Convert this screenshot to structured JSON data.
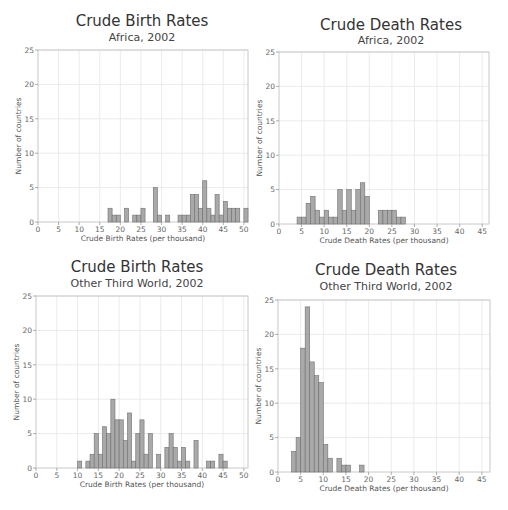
{
  "chart_data": [
    {
      "type": "bar",
      "title": "Crude Birth Rates",
      "subtitle": "Africa, 2002",
      "xlabel": "Crude Birth Rates (per thousand)",
      "ylabel": "Number of countries",
      "xlim": [
        0,
        51
      ],
      "ylim": [
        0,
        25
      ],
      "xticks": [
        0,
        5,
        10,
        15,
        20,
        25,
        30,
        35,
        40,
        45,
        50
      ],
      "yticks": [
        0,
        5,
        10,
        15,
        20,
        25
      ],
      "grid": true,
      "bin_width": 1,
      "x": [
        17,
        18,
        19,
        21,
        23,
        24,
        25,
        28,
        29,
        31,
        34,
        35,
        36,
        37,
        38,
        39,
        40,
        41,
        42,
        43,
        44,
        45,
        46,
        47,
        48,
        50
      ],
      "values": [
        2,
        1,
        1,
        2,
        1,
        1,
        2,
        5,
        1,
        1,
        1,
        1,
        1,
        4,
        4,
        2,
        6,
        2,
        1,
        4,
        1,
        3,
        2,
        2,
        2,
        2
      ]
    },
    {
      "type": "bar",
      "title": "Crude Death Rates",
      "subtitle": "Africa, 2002",
      "xlabel": "Crude Death Rates (per thousand)",
      "ylabel": "Number of countries",
      "xlim": [
        0,
        46.5
      ],
      "ylim": [
        0,
        25
      ],
      "xticks": [
        0,
        5,
        10,
        15,
        20,
        25,
        30,
        35,
        40,
        45
      ],
      "yticks": [
        0,
        5,
        10,
        15,
        20,
        25
      ],
      "grid": true,
      "bin_width": 1,
      "x": [
        4,
        5,
        6,
        7,
        8,
        9,
        10,
        11,
        12,
        13,
        14,
        15,
        16,
        17,
        18,
        19,
        22,
        23,
        24,
        25,
        26,
        27
      ],
      "values": [
        1,
        1,
        3,
        4,
        2,
        1,
        2,
        1,
        1,
        5,
        2,
        5,
        2,
        5,
        6,
        4,
        2,
        2,
        2,
        2,
        1,
        1
      ]
    },
    {
      "type": "bar",
      "title": "Crude Birth Rates",
      "subtitle": "Other Third World, 2002",
      "xlabel": "Crude Birth Rates (per thousand)",
      "ylabel": "Number of countries",
      "xlim": [
        0,
        51
      ],
      "ylim": [
        0,
        25
      ],
      "xticks": [
        0,
        5,
        10,
        15,
        20,
        25,
        30,
        35,
        40,
        45,
        50
      ],
      "yticks": [
        0,
        5,
        10,
        15,
        20,
        25
      ],
      "grid": true,
      "bin_width": 1,
      "x": [
        10,
        12,
        13,
        14,
        15,
        16,
        17,
        18,
        19,
        20,
        21,
        22,
        23,
        24,
        25,
        26,
        27,
        29,
        31,
        32,
        33,
        34,
        35,
        36,
        38,
        41,
        42,
        44,
        45
      ],
      "values": [
        1,
        1,
        2,
        5,
        2,
        6,
        5,
        10,
        7,
        7,
        4,
        8,
        1,
        5,
        7,
        2,
        5,
        2,
        3,
        5,
        3,
        1,
        3,
        1,
        4,
        1,
        1,
        2,
        1
      ]
    },
    {
      "type": "bar",
      "title": "Crude Death Rates",
      "subtitle": "Other Third World, 2002",
      "xlabel": "Crude Death Rates (per thousand)",
      "ylabel": "Number of countries",
      "xlim": [
        0,
        46.8
      ],
      "ylim": [
        0,
        25
      ],
      "xticks": [
        0,
        5,
        10,
        15,
        20,
        25,
        30,
        35,
        40,
        45
      ],
      "yticks": [
        0,
        5,
        10,
        15,
        20,
        25
      ],
      "grid": true,
      "bin_width": 1,
      "x": [
        3,
        4,
        5,
        6,
        7,
        8,
        9,
        10,
        11,
        13,
        14,
        15,
        18
      ],
      "values": [
        3,
        5,
        18,
        24,
        16,
        14,
        13,
        4,
        2,
        2,
        1,
        1,
        1
      ]
    }
  ]
}
